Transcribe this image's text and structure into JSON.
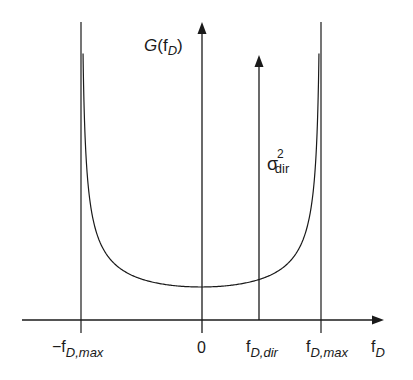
{
  "chart_data": {
    "type": "line",
    "title": "",
    "ylabel": "G(f_D)",
    "xlabel": "f_D",
    "x_ticks": [
      {
        "label": "−f",
        "sub": "D,max",
        "value": -1.0
      },
      {
        "label": "0",
        "sub": "",
        "value": 0.0
      },
      {
        "label": "f",
        "sub": "D,dir",
        "value": 0.45
      },
      {
        "label": "f",
        "sub": "D,max",
        "value": 1.0
      }
    ],
    "series": [
      {
        "name": "Jakes spectrum",
        "formula": "1/sqrt(1-(f/f_D,max)^2)",
        "x_range": [
          -0.983,
          0.983
        ]
      },
      {
        "name": "direct component",
        "type": "dirac",
        "x": 0.45,
        "label": "σ²_dir"
      }
    ],
    "grid": false,
    "legend": null
  },
  "axes": {
    "y_label_main": "G(f",
    "y_label_sub": "D",
    "y_label_close": ")",
    "x_label_main": "f",
    "x_label_sub": "D"
  },
  "ticks": {
    "neg_max": {
      "main": "−f",
      "sub": "D,max"
    },
    "zero": {
      "main": "0"
    },
    "dir": {
      "main": "f",
      "sub": "D,dir"
    },
    "max": {
      "main": "f",
      "sub": "D,max"
    }
  },
  "delta_label": {
    "main": "σ",
    "sup": "2",
    "sub": "dir"
  },
  "colors": {
    "stroke": "#1a1a1a",
    "background": "#ffffff"
  }
}
